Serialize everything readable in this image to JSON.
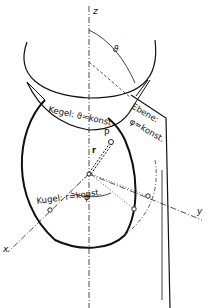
{
  "diagram": {
    "axes": {
      "z": "z",
      "x": "x",
      "y": "y"
    },
    "angles": {
      "theta": "ϑ",
      "phi": "φ"
    },
    "point": "P",
    "radius": "r",
    "surfaces": {
      "cone": "Kegel: ϑ=konst.",
      "plane_line1": "Ebene:",
      "plane_line2": "φ=konst.",
      "sphere": "Kugel: r=konst."
    }
  }
}
